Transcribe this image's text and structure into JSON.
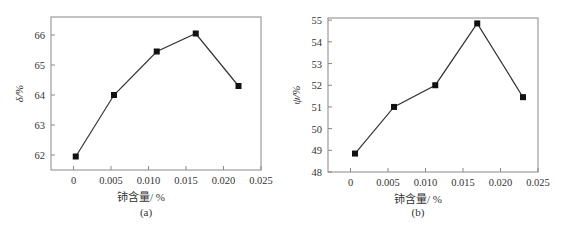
{
  "chart_data": [
    {
      "type": "line",
      "panel_label": "(a)",
      "title": "",
      "xlabel": "铈含量/ %",
      "ylabel": "δ/%",
      "xlim": [
        -0.003,
        0.025
      ],
      "ylim": [
        61.5,
        66.6
      ],
      "xticks": [
        0,
        0.005,
        0.01,
        0.015,
        0.02,
        0.025
      ],
      "xtick_labels": [
        "0",
        "0.005",
        "0.010",
        "0.015",
        "0.020",
        "0.025"
      ],
      "yticks": [
        62,
        63,
        64,
        65,
        66
      ],
      "ytick_labels": [
        "62",
        "63",
        "64",
        "65",
        "66"
      ],
      "grid": false,
      "marker": "square",
      "series": [
        {
          "name": "δ",
          "x": [
            0.0003,
            0.0054,
            0.0111,
            0.0163,
            0.022
          ],
          "y": [
            61.95,
            64.0,
            65.45,
            66.05,
            64.3
          ]
        }
      ]
    },
    {
      "type": "line",
      "panel_label": "(b)",
      "title": "",
      "xlabel": "铈含量/ %",
      "ylabel": "ψ/%",
      "xlim": [
        -0.003,
        0.025
      ],
      "ylim": [
        48,
        55.1
      ],
      "xticks": [
        0,
        0.005,
        0.01,
        0.015,
        0.02,
        0.025
      ],
      "xtick_labels": [
        "0",
        "0.005",
        "0.010",
        "0.015",
        "0.020",
        "0.025"
      ],
      "yticks": [
        48,
        49,
        50,
        51,
        52,
        53,
        54,
        55
      ],
      "ytick_labels": [
        "48",
        "49",
        "50",
        "51",
        "52",
        "53",
        "54",
        "55"
      ],
      "grid": false,
      "marker": "square",
      "series": [
        {
          "name": "ψ",
          "x": [
            0.0006,
            0.0058,
            0.0113,
            0.0169,
            0.023
          ],
          "y": [
            48.85,
            51.0,
            52.0,
            54.85,
            51.45
          ]
        }
      ]
    }
  ],
  "colors": {
    "axis": "#888888",
    "line": "#333333",
    "marker": "#111111",
    "text": "#333333"
  },
  "layout": [
    {
      "frame": {
        "left": 51,
        "top": 17,
        "right": 261,
        "bottom": 170
      }
    },
    {
      "frame": {
        "left": 45,
        "top": 18,
        "right": 255,
        "bottom": 172
      }
    }
  ]
}
